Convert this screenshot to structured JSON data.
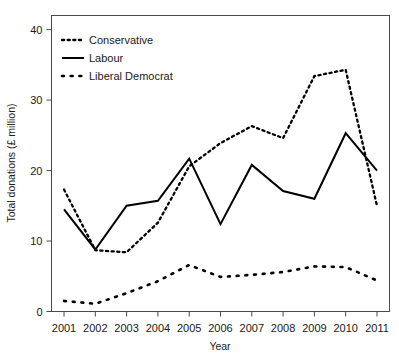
{
  "chart_data": {
    "type": "line",
    "title": "",
    "xlabel": "Year",
    "ylabel": "Total donations (£ million)",
    "categories": [
      "2001",
      "2002",
      "2003",
      "2004",
      "2005",
      "2006",
      "2007",
      "2008",
      "2009",
      "2010",
      "2011"
    ],
    "x": [
      2001,
      2002,
      2003,
      2004,
      2005,
      2006,
      2007,
      2008,
      2009,
      2010,
      2011
    ],
    "xlim": [
      2000.6,
      2011.4
    ],
    "ylim": [
      0,
      42
    ],
    "xticks": [
      "2001",
      "2002",
      "2003",
      "2004",
      "2005",
      "2006",
      "2007",
      "2008",
      "2009",
      "2010",
      "2011"
    ],
    "yticks": [
      "0",
      "10",
      "20",
      "30",
      "40"
    ],
    "ytick_values": [
      0,
      10,
      20,
      30,
      40
    ],
    "grid": false,
    "legend_position": "top-left",
    "series": [
      {
        "name": "Conservative",
        "style": "fine-dotted",
        "color": "#000000",
        "values": [
          17.3,
          8.7,
          8.4,
          12.6,
          20.6,
          23.9,
          26.3,
          24.6,
          33.4,
          34.3,
          15.0
        ]
      },
      {
        "name": "Labour",
        "style": "solid",
        "color": "#000000",
        "values": [
          14.5,
          8.8,
          15.0,
          15.7,
          21.7,
          12.4,
          20.8,
          17.1,
          16.0,
          25.3,
          20.0
        ]
      },
      {
        "name": "Liberal Democrat",
        "style": "coarse-dotted",
        "color": "#000000",
        "values": [
          1.5,
          1.1,
          2.6,
          4.3,
          6.6,
          4.9,
          5.2,
          5.6,
          6.4,
          6.3,
          4.4
        ]
      }
    ]
  },
  "legend": {
    "items": [
      {
        "label": "Conservative",
        "style": "fine-dotted"
      },
      {
        "label": "Labour",
        "style": "solid"
      },
      {
        "label": "Liberal Democrat",
        "style": "coarse-dotted"
      }
    ]
  },
  "axes": {
    "x_title": "Year",
    "y_title": "Total donations (£ million)"
  }
}
